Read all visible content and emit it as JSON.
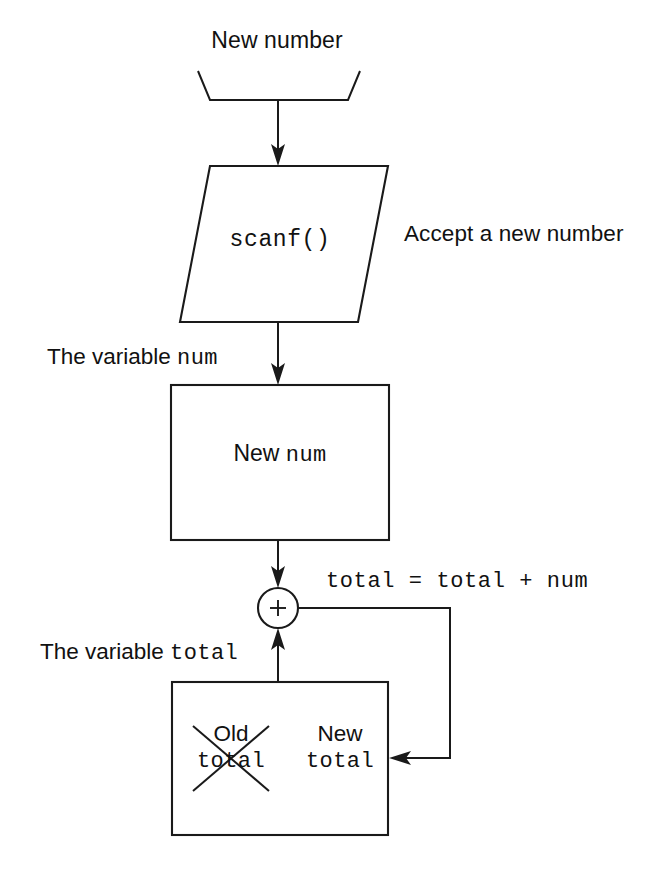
{
  "diagram": {
    "background_color": "#ffffff",
    "stroke_color": "#1a1a1a"
  },
  "nodes": {
    "input_funnel": {
      "shape": "funnel",
      "caption": "New number"
    },
    "scanf_parallelogram": {
      "shape": "parallelogram",
      "label": "scanf()",
      "annotation": "Accept a new number"
    },
    "num_box": {
      "shape": "rectangle",
      "caption": "The variable ",
      "caption_code": "num",
      "label_word": "New ",
      "label_code": "num"
    },
    "adder": {
      "shape": "circle",
      "operator": "+"
    },
    "total_box": {
      "shape": "rectangle",
      "caption": "The variable ",
      "caption_code": "total",
      "old_word": "Old",
      "old_code": "total",
      "new_word": "New",
      "new_code": "total",
      "old_struck_out": true
    }
  },
  "annotations": {
    "expression": "total = total + num"
  },
  "edges": [
    {
      "name": "funnel-to-scanf",
      "from": "input_funnel",
      "to": "scanf_parallelogram",
      "arrow": "down"
    },
    {
      "name": "scanf-to-num",
      "from": "scanf_parallelogram",
      "to": "num_box",
      "arrow": "down"
    },
    {
      "name": "num-to-adder",
      "from": "num_box",
      "to": "adder",
      "arrow": "down"
    },
    {
      "name": "total-to-adder",
      "from": "total_box",
      "to": "adder",
      "arrow": "up"
    },
    {
      "name": "adder-to-total-feedback",
      "from": "adder",
      "to": "total_box",
      "arrow": "left"
    }
  ]
}
